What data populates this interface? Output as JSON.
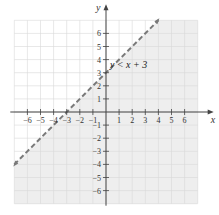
{
  "chart_data": {
    "type": "line",
    "title": "",
    "xlabel": "x",
    "ylabel": "y",
    "xlim": [
      -7,
      7
    ],
    "ylim": [
      -7,
      7
    ],
    "grid": true,
    "x_ticks": [
      -6,
      -5,
      -4,
      -3,
      -2,
      -1,
      1,
      2,
      3,
      4,
      5,
      6
    ],
    "y_ticks": [
      -6,
      -5,
      -4,
      -3,
      -2,
      -1,
      1,
      2,
      3,
      4,
      5,
      6
    ],
    "x_tick_labels": [
      "−6",
      "−5",
      "−4",
      "−3",
      "−2",
      "−1",
      "1",
      "2",
      "3",
      "4",
      "5",
      "6"
    ],
    "y_tick_labels": [
      "−6",
      "−5",
      "−4",
      "−3",
      "−2",
      "−1",
      "1",
      "2",
      "3",
      "4",
      "5",
      "6"
    ],
    "series": [
      {
        "name": "y = x + 3",
        "style": "dashed",
        "x": [
          -7,
          4
        ],
        "y": [
          -4,
          7
        ],
        "color": "#7a7a7a"
      }
    ],
    "shaded_region": {
      "description": "below the line",
      "inequality": "y < x + 3",
      "color": "#eeeeee"
    },
    "annotations": [
      {
        "text": "y < x + 3",
        "x": 2,
        "y": 3.5
      }
    ]
  },
  "colors": {
    "axis": "#444444",
    "grid": "#d8d8d8",
    "shade": "#eeeeee",
    "line": "#7a7a7a"
  }
}
